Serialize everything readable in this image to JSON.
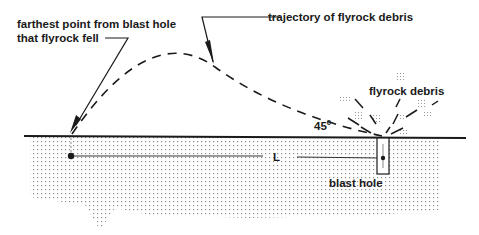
{
  "diagram": {
    "labels": {
      "farthest_point_line1": "farthest point from blast hole",
      "farthest_point_line2": "that flyrock fell",
      "trajectory": "trajectory of flyrock debris",
      "flyrock_debris": "flyrock debris",
      "angle_value": "45",
      "angle_superscript": "0",
      "distance": "L",
      "blast_hole": "blast hole"
    },
    "colors": {
      "ink": "#1a1a1a",
      "ground_dots": "#7a7a7a",
      "background": "#ffffff"
    }
  }
}
